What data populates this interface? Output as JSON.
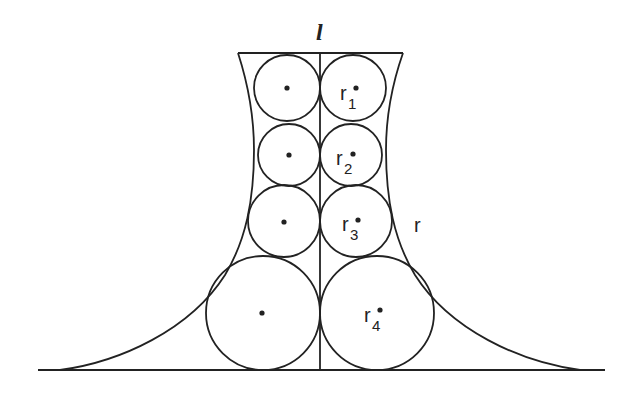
{
  "diagram": {
    "axis_label": "l",
    "curve_label": "r",
    "circles_left": [
      {
        "cx": 287,
        "cy": 88,
        "r": 34
      },
      {
        "cx": 288,
        "cy": 155,
        "r": 31
      },
      {
        "cx": 284,
        "cy": 221,
        "r": 36
      },
      {
        "cx": 262,
        "cy": 313,
        "r": 57
      }
    ],
    "circles_right": [
      {
        "cx": 354,
        "cy": 88,
        "r": 34,
        "label": "r",
        "sub": "1"
      },
      {
        "cx": 352,
        "cy": 155,
        "r": 31,
        "label": "r",
        "sub": "2"
      },
      {
        "cx": 357,
        "cy": 221,
        "r": 36,
        "label": "r",
        "sub": "3"
      },
      {
        "cx": 379,
        "cy": 313,
        "r": 57,
        "label": "r",
        "sub": "4"
      }
    ],
    "stroke_color": "#222222"
  }
}
